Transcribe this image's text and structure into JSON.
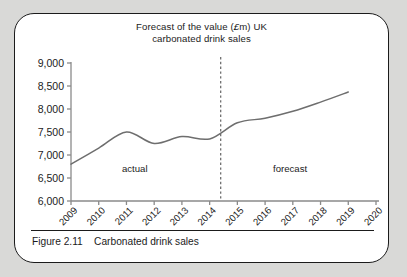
{
  "figure": {
    "caption_number": "Figure 2.11",
    "caption_text": "Carbonated drink sales",
    "caption_full": "Figure 2.11    Carbonated drink sales"
  },
  "chart_data": {
    "type": "line",
    "title": "Forecast of the value (£m) UK carbonated drink sales",
    "title_line1_pre": "Forecast of the value (",
    "title_line1_currency": "£",
    "title_line1_post": "m) UK",
    "title_line2": "carbonated drink sales",
    "xlabel": "",
    "ylabel": "",
    "ylim": [
      6000,
      9000
    ],
    "ytick_step": 500,
    "ytick_labels": [
      "9,000",
      "8,500",
      "8,000",
      "7,500",
      "7,000",
      "6,500",
      "6,000"
    ],
    "ytick_values": [
      9000,
      8500,
      8000,
      7500,
      7000,
      6500,
      6000
    ],
    "xtick_labels": [
      "2009",
      "2010",
      "2011",
      "2012",
      "2013",
      "2014",
      "2015",
      "2016",
      "2017",
      "2018",
      "2019",
      "2020"
    ],
    "x": [
      2009,
      2010,
      2011,
      2012,
      2013,
      2014,
      2015,
      2016,
      2017,
      2018,
      2019
    ],
    "values": [
      6800,
      7150,
      7500,
      7250,
      7400,
      7350,
      7700,
      7800,
      7950,
      8150,
      8370
    ],
    "series": [
      {
        "name": "UK carbonated drink sales",
        "values": [
          6800,
          7150,
          7500,
          7250,
          7400,
          7350,
          7700,
          7800,
          7950,
          8150,
          8370
        ]
      }
    ],
    "grid": false,
    "legend": "none",
    "annotations": [
      {
        "label": "actual",
        "x": 2011.3,
        "y": 6620
      },
      {
        "label": "forecast",
        "x": 2016.9,
        "y": 6620
      }
    ],
    "divider": {
      "label": "forecast-boundary",
      "x": 2014.4,
      "style": "dashed"
    },
    "line_color": "#6e6e6e",
    "axis_color": "#8a8a8a",
    "text_color": "#1b1b1b"
  }
}
